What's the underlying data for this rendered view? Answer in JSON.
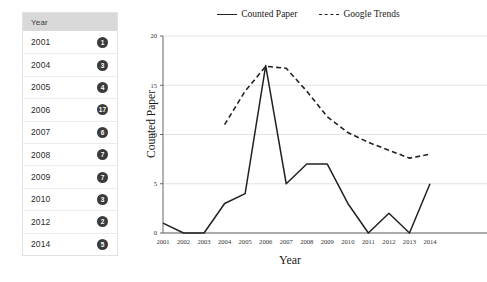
{
  "table": {
    "header": "Year",
    "rows": [
      {
        "year": "2001",
        "count": "1"
      },
      {
        "year": "2004",
        "count": "3"
      },
      {
        "year": "2005",
        "count": "4"
      },
      {
        "year": "2006",
        "count": "17"
      },
      {
        "year": "2007",
        "count": "6"
      },
      {
        "year": "2008",
        "count": "7"
      },
      {
        "year": "2009",
        "count": "7"
      },
      {
        "year": "2010",
        "count": "3"
      },
      {
        "year": "2012",
        "count": "2"
      },
      {
        "year": "2014",
        "count": "5"
      }
    ]
  },
  "chart_data": {
    "type": "line",
    "title": "",
    "xlabel": "Year",
    "ylabel": "Counted Paper",
    "y2label": "",
    "categories": [
      "2001",
      "2002",
      "2003",
      "2004",
      "2005",
      "2006",
      "2007",
      "2008",
      "2009",
      "2010",
      "2011",
      "2012",
      "2013",
      "2014"
    ],
    "ylim": [
      0,
      20
    ],
    "yticks": [
      "0",
      "5",
      "10",
      "15",
      "20"
    ],
    "y2lim": [
      0,
      5000
    ],
    "y2ticks": [
      "0",
      "1000",
      "2000",
      "3000",
      "4000",
      "5000"
    ],
    "grid": true,
    "legend_position": "top-center",
    "series": [
      {
        "name": "Counted Paper",
        "axis": "left",
        "style": "solid",
        "color": "#222222",
        "values": [
          1,
          0,
          0,
          3,
          4,
          17,
          5,
          7,
          7,
          3,
          0,
          2,
          0,
          5
        ]
      },
      {
        "name": "Google Trends",
        "axis": "right",
        "style": "dashed",
        "color": "#222222",
        "values": [
          null,
          null,
          null,
          2750,
          3600,
          4230,
          4180,
          3600,
          2950,
          2550,
          2300,
          2100,
          1900,
          2000
        ]
      }
    ]
  }
}
